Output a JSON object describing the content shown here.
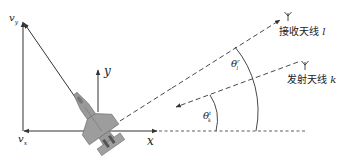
{
  "labels": {
    "vy_main": "v",
    "vy_sub": "y",
    "vx_main": "v",
    "vx_sub": "x",
    "axis_y": "y",
    "axis_x": "x",
    "theta_l_main": "θ",
    "theta_l_sub": "l",
    "theta_l_sup": "r",
    "theta_k_main": "θ",
    "theta_k_sub": "k",
    "theta_k_sup": "t",
    "rx_antenna_text": "接收天线",
    "rx_antenna_var": "l",
    "tx_antenna_text": "发射天线",
    "tx_antenna_var": "k"
  },
  "colors": {
    "line": "#333333",
    "aircraft_fill": "#9a9a9a",
    "aircraft_edge": "#6e6e6e"
  }
}
